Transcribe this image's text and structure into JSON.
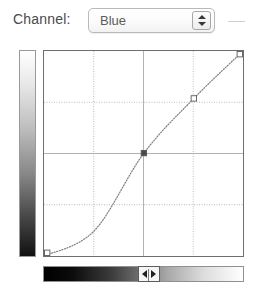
{
  "panel": {
    "channel_label": "Channel:",
    "channel_value": "Blue",
    "channel_options": [
      "Blue"
    ]
  },
  "chart_data": {
    "type": "line",
    "title": "",
    "xlabel": "",
    "ylabel": "",
    "xlim": [
      0,
      255
    ],
    "ylim": [
      0,
      255
    ],
    "grid": true,
    "grid_divisions": 4,
    "legend": null,
    "series": [
      {
        "name": "Blue curve",
        "style": "dotted",
        "x": [
          0,
          64,
          128,
          192,
          255
        ],
        "y": [
          0,
          31,
          128,
          196,
          255
        ]
      }
    ],
    "control_points": [
      {
        "x": 0,
        "y": 0,
        "selected": false
      },
      {
        "x": 128,
        "y": 128,
        "selected": true
      },
      {
        "x": 192,
        "y": 196,
        "selected": false
      },
      {
        "x": 255,
        "y": 255,
        "selected": false
      }
    ],
    "annotations": []
  },
  "output_ramp": {
    "name": "output-gradient",
    "orientation": "vertical",
    "from": "#ffffff",
    "to": "#000000"
  },
  "input_ramp": {
    "name": "input-gradient",
    "orientation": "horizontal",
    "from": "#000000",
    "to": "#ffffff",
    "handle_position_percent": 48
  },
  "colors": {
    "curve": "#7d7d7d",
    "grid": "#b3b3b3",
    "frame": "#6e6e6e",
    "point_selected": "#4a4a4a",
    "point_idle": "#ffffff",
    "text": "#4a4a4a"
  }
}
